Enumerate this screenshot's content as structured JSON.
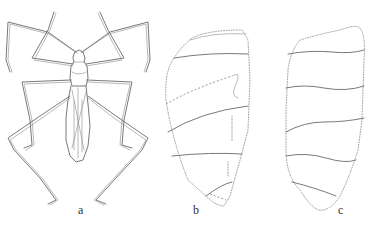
{
  "figure": {
    "panels": [
      {
        "id": "a",
        "label": "a",
        "subject": "insect-dorsal-view"
      },
      {
        "id": "b",
        "label": "b",
        "subject": "wing-outline"
      },
      {
        "id": "c",
        "label": "c",
        "subject": "wing-outline"
      }
    ],
    "colors": {
      "line": "#6a6a6a",
      "background": "#ffffff"
    }
  }
}
